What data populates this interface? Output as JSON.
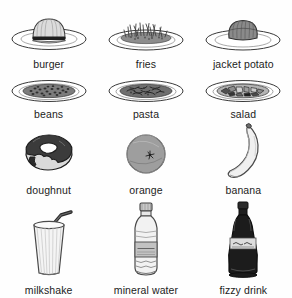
{
  "sheet": {
    "title": "food and drink picture vocabulary sheet",
    "background_color": "#fefefe",
    "text_color": "#1c1c1c",
    "columns": 3,
    "rows": 4
  },
  "items": [
    {
      "id": "burger",
      "label": "burger",
      "icon": "burger-on-plate-icon",
      "row": 1,
      "column": 1,
      "colors": {
        "main": "#d8d8d8",
        "outline": "#3a3a3a",
        "shadow": "#2b2b2b"
      }
    },
    {
      "id": "fries",
      "label": "fries",
      "icon": "fries-on-plate-icon",
      "row": 1,
      "column": 2,
      "colors": {
        "main": "#8e8e8e",
        "outline": "#3a3a3a",
        "shadow": "#555555"
      }
    },
    {
      "id": "jacket-potato",
      "label": "jacket potato",
      "icon": "jacket-potato-on-plate-icon",
      "row": 1,
      "column": 3,
      "colors": {
        "main": "#8a8a8a",
        "outline": "#333333",
        "shadow": "#5d5d5d"
      }
    },
    {
      "id": "beans",
      "label": "beans",
      "icon": "beans-on-plate-icon",
      "row": 2,
      "column": 1,
      "colors": {
        "main": "#7f7f7f",
        "outline": "#3a3a3a",
        "shadow": "#4a4a4a"
      }
    },
    {
      "id": "pasta",
      "label": "pasta",
      "icon": "pasta-on-plate-icon",
      "row": 2,
      "column": 2,
      "colors": {
        "main": "#6f6f6f",
        "outline": "#3a3a3a",
        "shadow": "#444444"
      }
    },
    {
      "id": "salad",
      "label": "salad",
      "icon": "salad-on-plate-icon",
      "row": 2,
      "column": 3,
      "colors": {
        "main": "#9a9a9a",
        "outline": "#3a3a3a",
        "shadow": "#2e2e2e"
      }
    },
    {
      "id": "doughnut",
      "label": "doughnut",
      "icon": "doughnut-icon",
      "row": 3,
      "column": 1,
      "colors": {
        "main": "#3b3b3b",
        "outline": "#1e1e1e",
        "shadow": "#d5d5d5"
      }
    },
    {
      "id": "orange",
      "label": "orange",
      "icon": "orange-fruit-icon",
      "row": 3,
      "column": 2,
      "colors": {
        "main": "#9e9e9e",
        "outline": "#4a4a4a",
        "shadow": "#6b6b6b"
      }
    },
    {
      "id": "banana",
      "label": "banana",
      "icon": "banana-icon",
      "row": 3,
      "column": 3,
      "colors": {
        "main": "#ededed",
        "outline": "#4a4a4a",
        "shadow": "#b8b8b8"
      }
    },
    {
      "id": "milkshake",
      "label": "milkshake",
      "icon": "milkshake-glass-icon",
      "row": 4,
      "column": 1,
      "colors": {
        "main": "#f2f2f2",
        "outline": "#5a5a5a",
        "shadow": "#2f2f2f"
      }
    },
    {
      "id": "mineral-water",
      "label": "mineral water",
      "icon": "water-bottle-icon",
      "row": 4,
      "column": 2,
      "colors": {
        "main": "#efefef",
        "outline": "#4f4f4f",
        "shadow": "#9a9a9a"
      }
    },
    {
      "id": "fizzy-drink",
      "label": "fizzy drink",
      "icon": "cola-bottle-icon",
      "row": 4,
      "column": 3,
      "colors": {
        "main": "#1c1c1c",
        "outline": "#111111",
        "shadow": "#cfcfcf"
      }
    }
  ]
}
